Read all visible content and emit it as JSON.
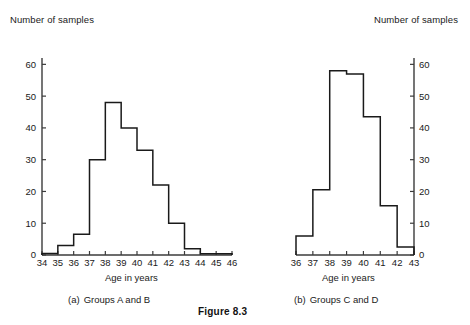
{
  "figure": {
    "caption": "Figure 8.3"
  },
  "panel_a": {
    "ylabel": "Number of samples",
    "xlabel": "Age in years",
    "caption_marker": "(a)",
    "caption_text": "Groups A and B"
  },
  "panel_b": {
    "ylabel": "Number of samples",
    "xlabel": "Age in years",
    "caption_marker": "(b)",
    "caption_text": "Groups C and D"
  },
  "chart_data": [
    {
      "id": "panel_a",
      "type": "bar",
      "subtype": "histogram",
      "title": "(a) Groups A and B",
      "xlabel": "Age in years",
      "ylabel": "Number of samples",
      "xlim": [
        34,
        46
      ],
      "ylim": [
        0,
        62
      ],
      "xticks": [
        34,
        35,
        36,
        37,
        38,
        39,
        40,
        41,
        42,
        43,
        44,
        45,
        46
      ],
      "yticks": [
        0,
        10,
        20,
        30,
        40,
        50,
        60
      ],
      "y_axis_side": "left",
      "grid": false,
      "legend": false,
      "bin_width": 1,
      "bin_edges": [
        34,
        35,
        36,
        37,
        38,
        39,
        40,
        41,
        42,
        43,
        44,
        45,
        46
      ],
      "categories": [
        "34-35",
        "35-36",
        "36-37",
        "37-38",
        "38-39",
        "39-40",
        "40-41",
        "41-42",
        "42-43",
        "43-44",
        "44-45",
        "45-46"
      ],
      "values": [
        0.5,
        3,
        6.5,
        30,
        48,
        40,
        33,
        22,
        10,
        2,
        0.4,
        0.4
      ]
    },
    {
      "id": "panel_b",
      "type": "bar",
      "subtype": "histogram",
      "title": "(b) Groups C and D",
      "xlabel": "Age in years",
      "ylabel": "Number of samples",
      "xlim": [
        36,
        43
      ],
      "ylim": [
        0,
        62
      ],
      "xticks": [
        36,
        37,
        38,
        39,
        40,
        41,
        42,
        43
      ],
      "yticks": [
        0,
        10,
        20,
        30,
        40,
        50,
        60
      ],
      "y_axis_side": "right",
      "grid": false,
      "legend": false,
      "bin_width": 1,
      "bin_edges": [
        36,
        37,
        38,
        39,
        40,
        41,
        42,
        43
      ],
      "categories": [
        "36-37",
        "37-38",
        "38-39",
        "39-40",
        "40-41",
        "41-42",
        "42-43"
      ],
      "values": [
        6,
        20.5,
        58,
        57,
        43.5,
        15.5,
        2.5
      ]
    }
  ]
}
